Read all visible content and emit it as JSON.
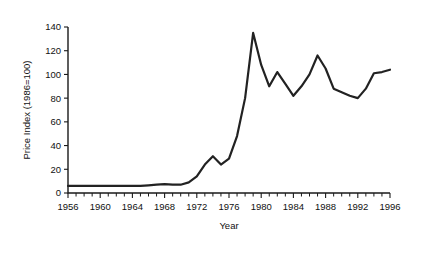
{
  "chart_data": {
    "type": "line",
    "title": "",
    "xlabel": "Year",
    "ylabel": "Price Index (1986=100)",
    "xlim": [
      1956,
      1996
    ],
    "ylim": [
      0,
      140
    ],
    "xticks": [
      1956,
      1960,
      1964,
      1968,
      1972,
      1976,
      1980,
      1984,
      1988,
      1992,
      1996
    ],
    "xtick_labels": [
      "1956",
      "1960",
      "1964",
      "1968",
      "1972",
      "1976",
      "1980",
      "1984",
      "1988",
      "1992",
      "1996"
    ],
    "ytick_labels": [
      "0",
      "20",
      "40",
      "60",
      "80",
      "100",
      "120",
      "140"
    ],
    "yticks": [
      0,
      20,
      40,
      60,
      80,
      100,
      120,
      140
    ],
    "minor_xtick_interval": 1,
    "grid": false,
    "legend": null,
    "line_color": "#222222",
    "series": [
      {
        "name": "Price Index",
        "x": [
          1956,
          1957,
          1958,
          1959,
          1960,
          1961,
          1962,
          1963,
          1964,
          1965,
          1966,
          1967,
          1968,
          1969,
          1970,
          1971,
          1972,
          1973,
          1974,
          1975,
          1976,
          1977,
          1978,
          1979,
          1980,
          1981,
          1982,
          1983,
          1984,
          1985,
          1986,
          1987,
          1988,
          1989,
          1990,
          1991,
          1992,
          1993,
          1994,
          1995,
          1996
        ],
        "values": [
          6,
          6,
          6,
          6,
          6,
          6,
          6,
          6,
          6,
          6,
          6.5,
          7,
          7.5,
          7,
          7,
          9,
          14,
          24,
          31,
          24,
          29,
          48,
          80,
          135,
          108,
          90,
          102,
          92,
          82,
          90,
          100,
          116,
          105,
          88,
          85,
          82,
          80,
          88,
          101,
          102,
          104
        ]
      }
    ],
    "annotations": [],
    "notes": {
      "peak_year": "1979",
      "peak_value": "135",
      "trough_after_peak_year": "1984",
      "trough_after_peak_value": "82",
      "end_value": "104"
    }
  }
}
